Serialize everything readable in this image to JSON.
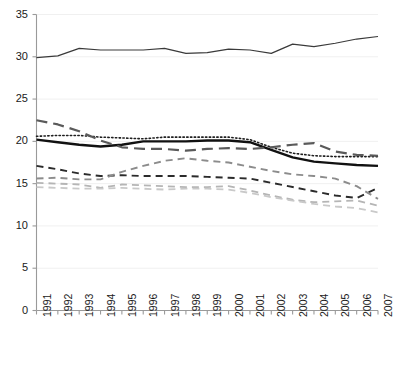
{
  "chart_data": {
    "type": "line",
    "title": "",
    "xlabel": "",
    "ylabel": "",
    "xlim": [
      1991,
      2007
    ],
    "ylim": [
      0,
      35
    ],
    "yticks": [
      0,
      5,
      10,
      15,
      20,
      25,
      30,
      35
    ],
    "grid": true,
    "legend": "none",
    "categories": [
      1991,
      1992,
      1993,
      1994,
      1995,
      1996,
      1997,
      1998,
      1999,
      2000,
      2001,
      2002,
      2003,
      2004,
      2005,
      2006,
      2007
    ],
    "tick_labels_x": [
      "1991",
      "1992",
      "1993",
      "1994",
      "1995",
      "1996",
      "1997",
      "1998",
      "1999",
      "2000",
      "2001",
      "2002",
      "2003",
      "2004",
      "2005",
      "2006",
      "2007"
    ],
    "tick_labels_y": [
      "0",
      "5",
      "10",
      "15",
      "20",
      "25",
      "30",
      "35"
    ],
    "series": [
      {
        "name": "top-solid-line",
        "style": "solid",
        "color": "#3a3a3a",
        "width": 1.2,
        "values": [
          29.9,
          30.1,
          31.0,
          30.8,
          30.8,
          30.8,
          31.0,
          30.4,
          30.5,
          30.9,
          30.8,
          30.4,
          31.5,
          31.2,
          31.6,
          32.1,
          32.4
        ]
      },
      {
        "name": "thick-solid-black-line",
        "style": "solid",
        "color": "#111111",
        "width": 2.4,
        "values": [
          20.2,
          19.9,
          19.6,
          19.4,
          19.6,
          20.0,
          20.0,
          20.0,
          20.1,
          20.1,
          19.9,
          19.0,
          18.1,
          17.6,
          17.4,
          17.2,
          17.1
        ]
      },
      {
        "name": "dotted-line",
        "style": "dotted",
        "color": "#1f1f1f",
        "width": 1.6,
        "values": [
          20.6,
          20.7,
          20.7,
          20.5,
          20.4,
          20.3,
          20.5,
          20.5,
          20.5,
          20.5,
          20.2,
          19.3,
          18.6,
          18.3,
          18.2,
          18.2,
          18.2
        ]
      },
      {
        "name": "dark-gray-long-dash-line",
        "style": "long-dash",
        "color": "#5a5a5a",
        "width": 2.2,
        "values": [
          22.5,
          22.0,
          21.2,
          20.1,
          19.3,
          19.1,
          19.1,
          18.9,
          19.1,
          19.2,
          19.1,
          19.3,
          19.6,
          19.8,
          18.8,
          18.4,
          18.3
        ]
      },
      {
        "name": "dark-dash-line-lower",
        "style": "dash",
        "color": "#2b2b2b",
        "width": 1.9,
        "values": [
          17.1,
          16.7,
          16.2,
          15.9,
          16.0,
          15.9,
          15.9,
          15.9,
          15.8,
          15.7,
          15.6,
          15.1,
          14.6,
          14.1,
          13.6,
          13.3,
          14.5
        ]
      },
      {
        "name": "mid-gray-dash-line",
        "style": "dash",
        "color": "#8c8c8c",
        "width": 1.9,
        "values": [
          15.6,
          15.7,
          15.5,
          15.5,
          16.4,
          17.1,
          17.7,
          18.0,
          17.7,
          17.5,
          17.0,
          16.5,
          16.1,
          15.9,
          15.6,
          14.7,
          13.2
        ]
      },
      {
        "name": "light-gray-dash-line-a",
        "style": "dash",
        "color": "#b5b5b5",
        "width": 1.8,
        "values": [
          15.1,
          15.0,
          14.9,
          14.5,
          14.9,
          14.8,
          14.7,
          14.6,
          14.6,
          14.7,
          14.2,
          13.6,
          13.1,
          12.8,
          12.9,
          13.0,
          12.4
        ]
      },
      {
        "name": "light-gray-dash-line-b",
        "style": "dash",
        "color": "#c9c9c9",
        "width": 1.8,
        "values": [
          14.6,
          14.5,
          14.4,
          14.4,
          14.5,
          14.4,
          14.3,
          14.4,
          14.4,
          14.3,
          13.9,
          13.4,
          13.0,
          12.6,
          12.3,
          12.1,
          11.6
        ]
      }
    ]
  },
  "axis": {
    "y_title": "",
    "x_title": ""
  }
}
